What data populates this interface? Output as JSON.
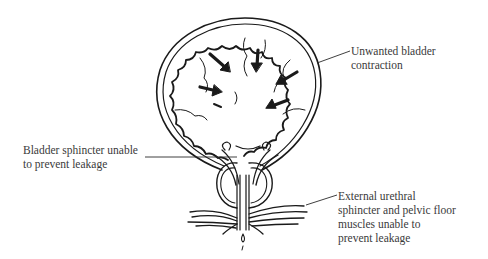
{
  "figure": {
    "labels": [
      {
        "id": "unwanted-contraction",
        "lines": [
          "Unwanted bladder",
          "contraction"
        ]
      },
      {
        "id": "bladder-sphincter",
        "lines": [
          "Bladder sphincter unable",
          "to prevent leakage"
        ]
      },
      {
        "id": "external-sphincter",
        "lines": [
          "External urethral",
          "sphincter and pelvic floor",
          "muscles unable to",
          "prevent leakage"
        ]
      }
    ],
    "arrows_count": 6,
    "colors": {
      "ink": "#1a1a1a",
      "text": "#3a3a3a",
      "background": "#ffffff"
    }
  }
}
